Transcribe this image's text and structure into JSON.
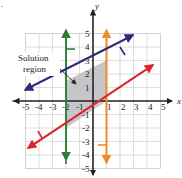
{
  "problem_marker": ".",
  "axes": {
    "x_label": "x",
    "y_label": "y",
    "x_ticks": [
      "-5",
      "-4",
      "-3",
      "-2",
      "-1",
      "1",
      "2",
      "3",
      "4",
      "5"
    ],
    "y_ticks": [
      "5",
      "4",
      "3",
      "2",
      "1",
      "-1",
      "-2",
      "-3",
      "-4",
      "-5"
    ],
    "range": [
      -5,
      5
    ]
  },
  "annotation": {
    "line1": "Solution",
    "line2": "region"
  },
  "boundaries": [
    {
      "name": "blue-line",
      "equation": "y = 0.5x + 2.5",
      "color": "#2b2a78",
      "shade_side": "below"
    },
    {
      "name": "red-line",
      "equation": "y = (2/3)(x - 1)",
      "color": "#d9262b",
      "shade_side": "above"
    },
    {
      "name": "green-line",
      "equation": "x = -2",
      "color": "#2e7d32",
      "shade_side": "right"
    },
    {
      "name": "orange-line",
      "equation": "x = 1",
      "color": "#f08a24",
      "shade_side": "left"
    }
  ],
  "solution_region": {
    "vertices": [
      [
        -2,
        1.5
      ],
      [
        1,
        3
      ],
      [
        1,
        0
      ],
      [
        -2,
        -2
      ]
    ],
    "fill": "#c0c0c4"
  }
}
